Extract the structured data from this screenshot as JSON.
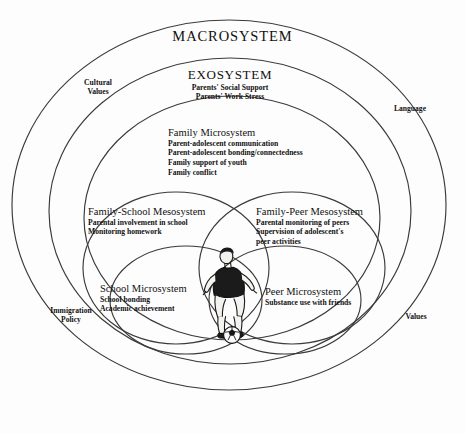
{
  "diagram": {
    "title": "MACROSYSTEM",
    "macrosystem": {
      "label": "MACROSYSTEM",
      "peripheral_labels": [
        {
          "name": "cultural-values",
          "line1": "Cultural",
          "line2": "Values"
        },
        {
          "name": "language",
          "line1": "Language",
          "line2": ""
        },
        {
          "name": "immigration-policy",
          "line1": "Immigration",
          "line2": "Policy"
        },
        {
          "name": "values",
          "line1": "Values",
          "line2": ""
        }
      ]
    },
    "exosystem": {
      "label": "EXOSYSTEM",
      "items": [
        "Parents' Social Support",
        "Parents' Work Stress"
      ]
    },
    "family_microsystem": {
      "label": "Family Microsystem",
      "items": [
        "Parent-adolescent communication",
        "Parent-adolescent bonding/connectedness",
        "Family support of youth",
        "Family conflict"
      ]
    },
    "family_school_mesosystem": {
      "label": "Family-School Mesosystem",
      "items": [
        "Parental involvement in school",
        "Monitoring homework"
      ]
    },
    "family_peer_mesosystem": {
      "label": "Family-Peer Mesosystem",
      "items": [
        "Parental monitoring of peers",
        "Supervision of adolescent's",
        "peer activities"
      ]
    },
    "school_microsystem": {
      "label": "School Microsystem",
      "items": [
        "School bonding",
        "Academic achievement"
      ]
    },
    "peer_microsystem": {
      "label": "Peer Microsystem",
      "items": [
        "Substance use with friends"
      ]
    },
    "center_figure": {
      "name": "adolescent-soccer-player-illustration",
      "description": "Adolescent soccer player with ball"
    },
    "colors": {
      "stroke": "#3a3a3a",
      "text": "#101010",
      "background": "#fdfdfd",
      "figure_jersey": "#1a1a1a"
    }
  }
}
